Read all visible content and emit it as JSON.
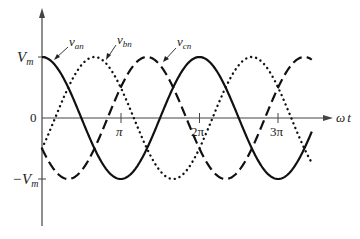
{
  "chart_data": {
    "type": "line",
    "title": "",
    "xlabel": "ωt",
    "ylabel": "",
    "x_ticks": [
      {
        "label": "π",
        "value": 3.14159
      },
      {
        "label": "2π",
        "value": 6.28318
      },
      {
        "label": "3π",
        "value": 9.42478
      }
    ],
    "y_ticks": [
      {
        "label": "V_m",
        "value": 1
      },
      {
        "label": "0",
        "value": 0
      },
      {
        "label": "−V_m",
        "value": -1
      }
    ],
    "x_range": [
      0,
      10.77
    ],
    "ylim": [
      -1.0,
      1.0
    ],
    "grid": false,
    "series": [
      {
        "name": "v_an",
        "formula": "Vm·cos(ωt)",
        "phase_deg": 0,
        "style": "solid"
      },
      {
        "name": "v_bn",
        "formula": "Vm·cos(ωt − 120°)",
        "phase_deg": -120,
        "style": "dotted"
      },
      {
        "name": "v_cn",
        "formula": "Vm·cos(ωt + 120°)",
        "phase_deg": 120,
        "style": "dashed"
      }
    ],
    "annotations": [
      {
        "text": "v_an",
        "points_to": "v_an curve near ωt≈0.3"
      },
      {
        "text": "v_bn",
        "points_to": "v_bn curve near ωt≈2.8"
      },
      {
        "text": "v_cn",
        "points_to": "v_cn curve near ωt≈5.0"
      }
    ]
  },
  "labels": {
    "vm": "V",
    "vm_sub": "m",
    "neg_vm": "−V",
    "neg_vm_sub": "m",
    "zero": "0",
    "pi": "π",
    "two_pi": "2π",
    "three_pi": "3π",
    "omega": "ω",
    "t": "t",
    "van": "v",
    "van_sub": "an",
    "vbn": "v",
    "vbn_sub": "bn",
    "vcn": "v",
    "vcn_sub": "cn"
  }
}
